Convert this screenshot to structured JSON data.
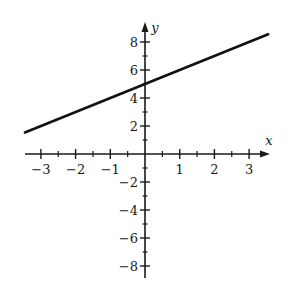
{
  "chart_data": {
    "type": "line",
    "title": "",
    "xlabel": "x",
    "ylabel": "y",
    "xlim": [
      -3.5,
      3.6
    ],
    "ylim": [
      -8.8,
      9.5
    ],
    "grid": false,
    "legend": null,
    "x_ticks": [
      -3,
      -2,
      -1,
      1,
      2,
      3
    ],
    "x_minor_ticks": [
      -2.5,
      -1.5,
      -0.5,
      0.5,
      1.5,
      2.5
    ],
    "y_ticks": [
      -8,
      -6,
      -4,
      -2,
      2,
      4,
      6,
      8
    ],
    "y_minor_ticks": [
      -7,
      -5,
      -3,
      -1,
      1,
      3,
      5,
      7
    ],
    "series": [
      {
        "name": "y = x + 5",
        "equation": "y = x + 5",
        "x": [
          -3.46,
          3.55
        ],
        "y": [
          1.54,
          8.55
        ],
        "color": "#111111"
      }
    ]
  },
  "layout": {
    "origin_px": [
      145,
      154
    ],
    "px_per_x": 34.7,
    "px_per_y": 14,
    "x_axis_px": [
      25,
      270
    ],
    "y_axis_px": [
      278,
      22
    ]
  }
}
